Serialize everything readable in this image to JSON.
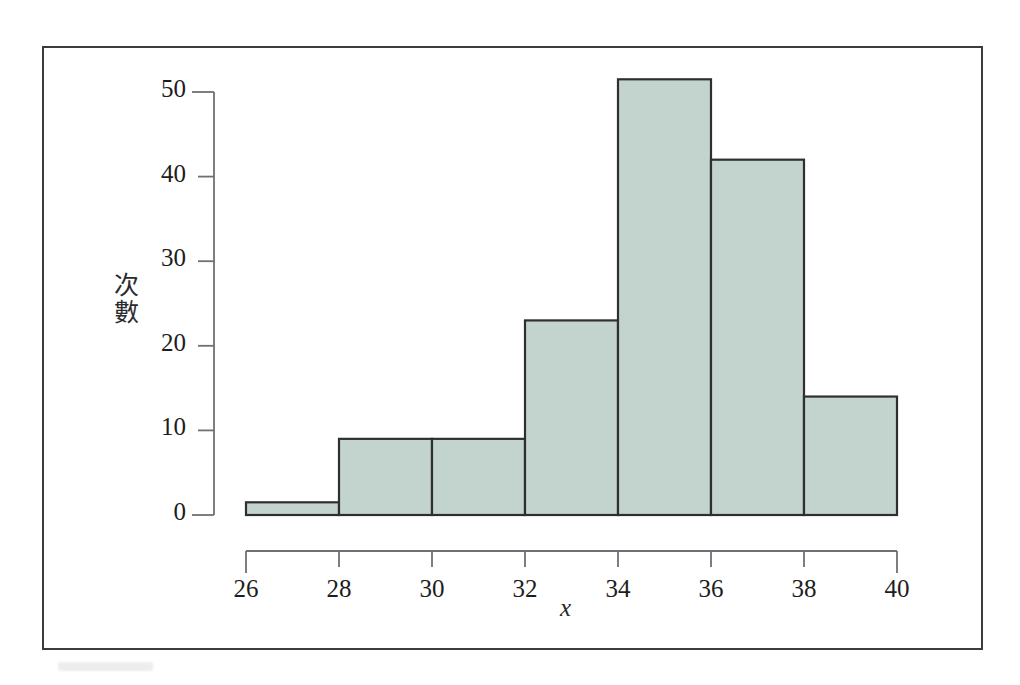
{
  "figure": {
    "kind": "histogram-figure",
    "background_color": "#ffffff",
    "frame_color": "#3b3b41"
  },
  "axes": {
    "y_label": "次數",
    "y_label_chars": [
      "次",
      "數"
    ],
    "x_label": "x",
    "x_ticks": [
      "26",
      "28",
      "30",
      "32",
      "34",
      "36",
      "38",
      "40"
    ],
    "y_ticks": [
      "0",
      "10",
      "20",
      "30",
      "40",
      "50"
    ]
  },
  "style": {
    "bar_fill": "#c3d3cd",
    "bar_stroke": "#2f2f33",
    "axis_color": "#6f6f75",
    "text_color": "#1d1d20"
  },
  "chart_data": {
    "type": "bar",
    "title": "",
    "subtitle": "",
    "xlabel": "x",
    "ylabel": "次數",
    "categories": [
      "26-28",
      "28-30",
      "30-32",
      "32-34",
      "34-36",
      "36-38",
      "38-40"
    ],
    "bin_edges": [
      26,
      28,
      30,
      32,
      34,
      36,
      38,
      40
    ],
    "bin_width": 2,
    "values": [
      1.5,
      9,
      9,
      23,
      51.5,
      42,
      14
    ],
    "xlim": [
      26,
      40
    ],
    "ylim": [
      0,
      53
    ],
    "x_tick_values": [
      26,
      28,
      30,
      32,
      34,
      36,
      38,
      40
    ],
    "y_tick_values": [
      0,
      10,
      20,
      30,
      40,
      50
    ],
    "grid": false,
    "legend": false,
    "legend_position": "none",
    "annotations": []
  }
}
